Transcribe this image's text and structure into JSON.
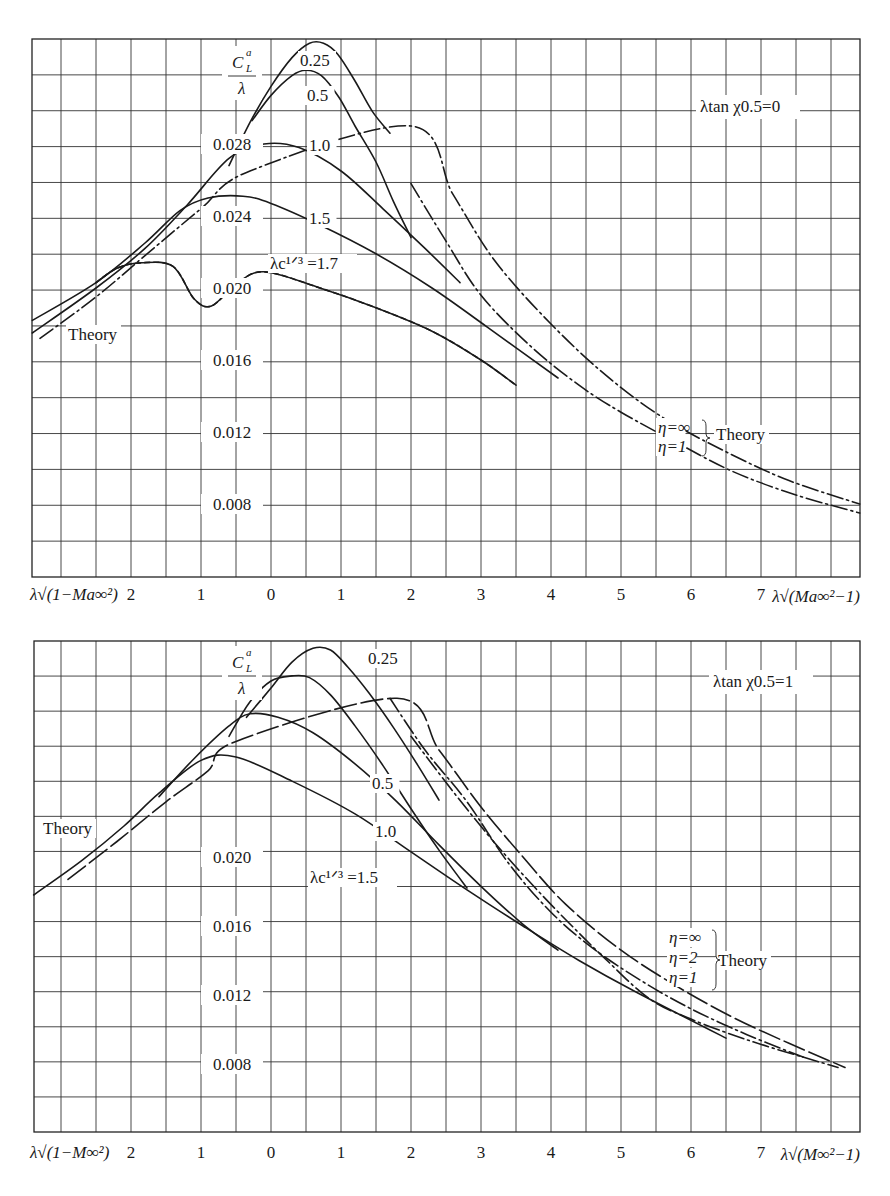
{
  "chart_data": [
    {
      "type": "line",
      "title": "λtan χ0.5=0",
      "ylabel": "C_L^a / λ",
      "xlabel_left": "λ√(1−Ma∞²)",
      "xlabel_right": "λ√(Ma∞²−1)",
      "x_tick_labels": [
        "2",
        "1",
        "0",
        "1",
        "2",
        "3",
        "4",
        "5",
        "6",
        "7"
      ],
      "x_tick_values": [
        -2,
        -1,
        0,
        1,
        2,
        3,
        4,
        5,
        6,
        7
      ],
      "y_tick_labels": [
        "0.028",
        "0.024",
        "0.020",
        "0.016",
        "0.012",
        "0.008"
      ],
      "y_tick_values": [
        0.028,
        0.024,
        0.02,
        0.016,
        0.012,
        0.008
      ],
      "xlim": [
        -3.41,
        8.41
      ],
      "ylim": [
        0.0039,
        0.0338
      ],
      "grid": true,
      "note": "x < 0 denotes subsonic side λ√(1−Ma∞²); x > 0 denotes supersonic side λ√(Ma∞²−1)",
      "series": [
        {
          "name": "λc^(1/3)=0.25",
          "style": "solid",
          "x": [
            -0.6,
            -0.3,
            0.0,
            0.3,
            0.55,
            0.75,
            0.95,
            1.2,
            1.45,
            1.7
          ],
          "y": [
            0.0268,
            0.0292,
            0.0312,
            0.0328,
            0.0336,
            0.0336,
            0.033,
            0.0315,
            0.0298,
            0.0286
          ]
        },
        {
          "name": "λc^(1/3)=0.5",
          "style": "solid",
          "x": [
            -0.27,
            0.0,
            0.3,
            0.5,
            0.72,
            0.97,
            1.2,
            1.5,
            1.75,
            2.0
          ],
          "y": [
            0.0293,
            0.0307,
            0.0318,
            0.0321,
            0.0318,
            0.0306,
            0.029,
            0.027,
            0.0248,
            0.0228
          ]
        },
        {
          "name": "λc^(1/3)=1.0",
          "style": "solid",
          "x": [
            -3.41,
            -2.5,
            -1.8,
            -1.2,
            -0.6,
            -0.1,
            0.4,
            1.0,
            1.6,
            2.2,
            2.7
          ],
          "y": [
            0.0175,
            0.02,
            0.0222,
            0.0246,
            0.0272,
            0.028,
            0.0278,
            0.0265,
            0.0244,
            0.0222,
            0.0203
          ]
        },
        {
          "name": "λc^(1/3)=1.5",
          "style": "solid",
          "x": [
            -3.41,
            -2.5,
            -1.8,
            -1.3,
            -0.9,
            -0.4,
            0.0,
            0.7,
            1.5,
            2.3,
            3.1,
            4.1
          ],
          "y": [
            0.0182,
            0.0203,
            0.0225,
            0.0243,
            0.025,
            0.0251,
            0.0247,
            0.0235,
            0.0219,
            0.02,
            0.0178,
            0.015
          ]
        },
        {
          "name": "λc^(1/3)=1.7",
          "style": "solid+dashed",
          "x": [
            -2.5,
            -2.2,
            -1.85,
            -1.4,
            -1.1,
            -0.85,
            -0.5,
            -0.1,
            0.7,
            1.5,
            2.3,
            3.0,
            3.5
          ],
          "y": [
            0.0203,
            0.0211,
            0.0214,
            0.0212,
            0.0194,
            0.019,
            0.0202,
            0.0209,
            0.02,
            0.0189,
            0.0176,
            0.016,
            0.0146
          ]
        },
        {
          "name": "Theory η=∞",
          "style": "dashdot",
          "x": [
            -3.3,
            -2.5,
            -1.8,
            -1.0,
            -0.3,
            2.0,
            2.6,
            3.2,
            4.0,
            4.8,
            5.6,
            6.5,
            7.4,
            8.41
          ],
          "y": [
            0.0172,
            0.0195,
            0.0218,
            0.0244,
            0.0265,
            0.029,
            0.0252,
            0.0215,
            0.018,
            0.0151,
            0.0128,
            0.0109,
            0.0093,
            0.008
          ]
        },
        {
          "name": "Theory η=1",
          "style": "dashdot",
          "x": [
            2.0,
            2.5,
            3.0,
            3.7,
            4.4,
            5.0,
            5.8,
            6.6,
            7.5,
            8.41
          ],
          "y": [
            0.0258,
            0.0226,
            0.0196,
            0.0168,
            0.0146,
            0.0131,
            0.0114,
            0.0098,
            0.0085,
            0.0075
          ]
        }
      ],
      "annotations": [
        "0.25",
        "0.5",
        "1.0",
        "1.5",
        "λc^(1/3) =1.7",
        "Theory",
        "η=∞",
        "η=1",
        "Theory",
        "λtan χ0.5=0"
      ]
    },
    {
      "type": "line",
      "title": "λtan χ0.5=1",
      "ylabel": "C_L^a / λ",
      "xlabel_left": "λ√(1−M∞²)",
      "xlabel_right": "λ√(M∞²−1)",
      "x_tick_labels": [
        "2",
        "1",
        "0",
        "1",
        "2",
        "3",
        "4",
        "5",
        "6",
        "7"
      ],
      "x_tick_values": [
        -2,
        -1,
        0,
        1,
        2,
        3,
        4,
        5,
        6,
        7
      ],
      "y_tick_labels": [
        "0.020",
        "0.016",
        "0.012",
        "0.008"
      ],
      "y_tick_values": [
        0.02,
        0.016,
        0.012,
        0.008
      ],
      "xlim": [
        -3.39,
        8.41
      ],
      "ylim": [
        0.0045,
        0.0325
      ],
      "grid": true,
      "note": "x < 0 denotes subsonic side λ√(1−M∞²); x > 0 denotes supersonic side λ√(M∞²−1)",
      "series": [
        {
          "name": "λc^(1/3)=0.25",
          "style": "solid",
          "x": [
            -0.35,
            0.0,
            0.3,
            0.6,
            0.85,
            1.1,
            1.4,
            1.75,
            2.1,
            2.4
          ],
          "y": [
            0.0281,
            0.0298,
            0.0313,
            0.0321,
            0.032,
            0.031,
            0.0295,
            0.0275,
            0.0253,
            0.0233
          ]
        },
        {
          "name": "λc^(1/3)=0.5",
          "style": "solid",
          "x": [
            -0.6,
            -0.3,
            0.0,
            0.3,
            0.55,
            0.85,
            1.2,
            1.6,
            2.0,
            2.4,
            2.8
          ],
          "y": [
            0.027,
            0.029,
            0.0302,
            0.0305,
            0.0304,
            0.0294,
            0.0276,
            0.0253,
            0.0228,
            0.0204,
            0.0182
          ]
        },
        {
          "name": "λc^(1/3)=1.0",
          "style": "solid",
          "x": [
            -1.6,
            -1.1,
            -0.6,
            -0.3,
            0.1,
            0.6,
            1.2,
            1.8,
            2.4,
            3.0,
            3.6,
            4.1
          ],
          "y": [
            0.0235,
            0.0257,
            0.0276,
            0.0283,
            0.0281,
            0.0272,
            0.0254,
            0.0232,
            0.0207,
            0.0183,
            0.0161,
            0.0146
          ]
        },
        {
          "name": "λc^(1/3)=1.5",
          "style": "solid",
          "x": [
            -3.39,
            -2.7,
            -2.1,
            -1.6,
            -1.0,
            -0.5,
            0.3,
            1.2,
            2.0,
            2.8,
            3.6,
            4.4,
            5.2,
            6.5
          ],
          "y": [
            0.0178,
            0.0198,
            0.0218,
            0.0237,
            0.0256,
            0.0258,
            0.0244,
            0.0225,
            0.0203,
            0.0181,
            0.016,
            0.014,
            0.0122,
            0.0095
          ]
        },
        {
          "name": "Theory η=∞",
          "style": "longdash",
          "x": [
            -2.9,
            -2.2,
            -1.5,
            -0.9,
            -0.5,
            1.8,
            2.4,
            3.0,
            3.6,
            4.2,
            5.0,
            5.8,
            6.6,
            7.4,
            8.2
          ],
          "y": [
            0.0187,
            0.0209,
            0.0232,
            0.025,
            0.0267,
            0.0292,
            0.0262,
            0.0229,
            0.02,
            0.0173,
            0.0146,
            0.0125,
            0.0107,
            0.0092,
            0.0078
          ]
        },
        {
          "name": "Theory η=2",
          "style": "dashdot",
          "x": [
            1.7,
            2.2,
            2.8,
            3.4,
            4.0,
            4.6,
            5.3,
            6.0,
            6.8,
            7.6
          ],
          "y": [
            0.0292,
            0.0262,
            0.0232,
            0.0196,
            0.0168,
            0.0147,
            0.0128,
            0.0112,
            0.0097,
            0.0084
          ]
        },
        {
          "name": "Theory η=1",
          "style": "dashdot",
          "x": [
            2.0,
            2.6,
            3.2,
            3.8,
            4.3,
            4.8,
            5.4,
            6.0,
            6.8,
            7.6,
            8.1
          ],
          "y": [
            0.027,
            0.0238,
            0.0208,
            0.0181,
            0.016,
            0.014,
            0.0118,
            0.0106,
            0.0094,
            0.0084,
            0.0078
          ]
        }
      ],
      "annotations": [
        "0.25",
        "0.5",
        "1.0",
        "λc^(1/3) =1.5",
        "Theory",
        "η=∞",
        "η=2",
        "η=1",
        "Theory",
        "λtan χ0.5=1"
      ]
    }
  ],
  "top_chart": {
    "condition": "λtan χ0.5=0",
    "ylabel_num": "C",
    "ylabel_sub": "L",
    "ylabel_sup": "a",
    "ylabel_den": "λ",
    "y_ticks": [
      {
        "label": "0.028",
        "value": 0.028
      },
      {
        "label": "0.024",
        "value": 0.024
      },
      {
        "label": "0.020",
        "value": 0.02
      },
      {
        "label": "0.016",
        "value": 0.016
      },
      {
        "label": "0.012",
        "value": 0.012
      },
      {
        "label": "0.008",
        "value": 0.008
      }
    ],
    "x_ticks": [
      "2",
      "1",
      "0",
      "1",
      "2",
      "3",
      "4",
      "5",
      "6",
      "7"
    ],
    "xlabel_left": "λ√(1−Ma∞²)",
    "xlabel_right": "λ√(Ma∞²−1)",
    "curve_labels": {
      "c025": "0.25",
      "c05": "0.5",
      "c10": "1.0",
      "c15": "1.5",
      "c17": "λc¹ᐟ³ =1.7",
      "theory_left": "Theory",
      "eta_inf": "η=∞",
      "eta_1": "η=1",
      "theory_right": "Theory"
    }
  },
  "bottom_chart": {
    "condition": "λtan χ0.5=1",
    "ylabel_num": "C",
    "ylabel_sub": "L",
    "ylabel_sup": "a",
    "ylabel_den": "λ",
    "y_ticks": [
      {
        "label": "0.020",
        "value": 0.02
      },
      {
        "label": "0.016",
        "value": 0.016
      },
      {
        "label": "0.012",
        "value": 0.012
      },
      {
        "label": "0.008",
        "value": 0.008
      }
    ],
    "x_ticks": [
      "2",
      "1",
      "0",
      "1",
      "2",
      "3",
      "4",
      "5",
      "6",
      "7"
    ],
    "xlabel_left": "λ√(1−M∞²)",
    "xlabel_right": "λ√(M∞²−1)",
    "curve_labels": {
      "c025": "0.25",
      "c05": "0.5",
      "c10": "1.0",
      "c15": "λc¹ᐟ³ =1.5",
      "theory_left": "Theory",
      "eta_inf": "η=∞",
      "eta_2": "η=2",
      "eta_1": "η=1",
      "theory_right": "Theory"
    }
  }
}
